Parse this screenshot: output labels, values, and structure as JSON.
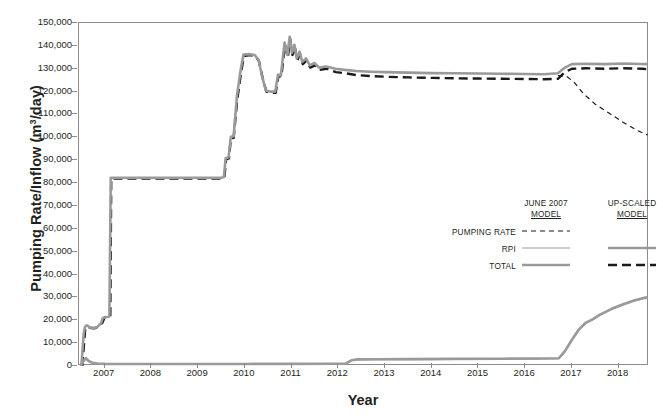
{
  "chart_data": {
    "type": "line",
    "title": "",
    "xlabel": "Year",
    "ylabel": "Pumping Rate/Inflow (m3/day)",
    "ylabel_parts": {
      "pre": "Pumping Rate/Inflow (m",
      "sup": "3",
      "post": "/day)"
    },
    "grid": false,
    "xlim": [
      2006.45,
      2018.65
    ],
    "ylim": [
      0,
      150000
    ],
    "ytick_step": 10000,
    "yticks": [
      "0",
      "10,000",
      "20,000",
      "30,000",
      "40,000",
      "50,000",
      "60,000",
      "70,000",
      "80,000",
      "90,000",
      "100,000",
      "110,000",
      "120,000",
      "130,000",
      "140,000",
      "150,000"
    ],
    "ytick_values": [
      0,
      10000,
      20000,
      30000,
      40000,
      50000,
      60000,
      70000,
      80000,
      90000,
      100000,
      110000,
      120000,
      130000,
      140000,
      150000
    ],
    "xticks": [
      "2007",
      "2008",
      "2009",
      "2010",
      "2011",
      "2012",
      "2013",
      "2014",
      "2015",
      "2016",
      "2017",
      "2018"
    ],
    "xtick_values": [
      2007,
      2008,
      2009,
      2010,
      2011,
      2012,
      2013,
      2014,
      2015,
      2016,
      2017,
      2018
    ],
    "legend_position": "inside-right",
    "colors": {
      "gray": "#9a9a9a",
      "black": "#1a1a1a",
      "axis": "#8c8c8c"
    },
    "series": [
      {
        "name": "TOTAL up-scaled model",
        "legend_row": "TOTAL",
        "legend_column": "UP-SCALED MODEL",
        "style": "dashed-thick",
        "color": "#1a1a1a",
        "points": [
          [
            2006.52,
            0
          ],
          [
            2006.58,
            15500
          ],
          [
            2006.62,
            17400
          ],
          [
            2006.7,
            16600
          ],
          [
            2006.78,
            16500
          ],
          [
            2006.86,
            17100
          ],
          [
            2006.95,
            18900
          ],
          [
            2007.0,
            21300
          ],
          [
            2007.06,
            21500
          ],
          [
            2007.12,
            21600
          ],
          [
            2007.14,
            82000
          ],
          [
            2009.52,
            82000
          ],
          [
            2009.56,
            82200
          ],
          [
            2009.6,
            90500
          ],
          [
            2009.66,
            90800
          ],
          [
            2009.7,
            99500
          ],
          [
            2009.76,
            99800
          ],
          [
            2009.84,
            117000
          ],
          [
            2009.92,
            128500
          ],
          [
            2009.98,
            135500
          ],
          [
            2010.1,
            136000
          ],
          [
            2010.22,
            135600
          ],
          [
            2010.3,
            133500
          ],
          [
            2010.38,
            126000
          ],
          [
            2010.46,
            120000
          ],
          [
            2010.54,
            119500
          ],
          [
            2010.66,
            119500
          ],
          [
            2010.72,
            127000
          ],
          [
            2010.78,
            126500
          ],
          [
            2010.86,
            140500
          ],
          [
            2010.92,
            135000
          ],
          [
            2010.97,
            143000
          ],
          [
            2011.02,
            136000
          ],
          [
            2011.07,
            139500
          ],
          [
            2011.12,
            133500
          ],
          [
            2011.18,
            136500
          ],
          [
            2011.24,
            132000
          ],
          [
            2011.32,
            133500
          ],
          [
            2011.4,
            130500
          ],
          [
            2011.5,
            131500
          ],
          [
            2011.6,
            129500
          ],
          [
            2011.75,
            130000
          ],
          [
            2011.95,
            128500
          ],
          [
            2012.15,
            128000
          ],
          [
            2012.4,
            127200
          ],
          [
            2012.7,
            126800
          ],
          [
            2013.0,
            126500
          ],
          [
            2013.5,
            126200
          ],
          [
            2014.0,
            126000
          ],
          [
            2014.5,
            125800
          ],
          [
            2015.0,
            125700
          ],
          [
            2015.5,
            125600
          ],
          [
            2016.0,
            125500
          ],
          [
            2016.4,
            125400
          ],
          [
            2016.7,
            125600
          ],
          [
            2016.85,
            128500
          ],
          [
            2017.0,
            130000
          ],
          [
            2017.3,
            130200
          ],
          [
            2017.7,
            130000
          ],
          [
            2018.1,
            130200
          ],
          [
            2018.5,
            130000
          ],
          [
            2018.62,
            129800
          ]
        ]
      },
      {
        "name": "TOTAL June 2007 model / RPI up-scaled (upper gray band)",
        "legend_row": "TOTAL",
        "legend_column": "JUNE 2007 MODEL",
        "style": "solid-thick",
        "color": "#9a9a9a",
        "points": [
          [
            2006.5,
            0
          ],
          [
            2006.55,
            14000
          ],
          [
            2006.58,
            17200
          ],
          [
            2006.62,
            17800
          ],
          [
            2006.68,
            16900
          ],
          [
            2006.76,
            16600
          ],
          [
            2006.84,
            17000
          ],
          [
            2006.92,
            18700
          ],
          [
            2006.96,
            21000
          ],
          [
            2007.04,
            21400
          ],
          [
            2007.1,
            21700
          ],
          [
            2007.13,
            82300
          ],
          [
            2009.5,
            82300
          ],
          [
            2009.55,
            82600
          ],
          [
            2009.59,
            91000
          ],
          [
            2009.65,
            91200
          ],
          [
            2009.7,
            100200
          ],
          [
            2009.76,
            100500
          ],
          [
            2009.83,
            118000
          ],
          [
            2009.91,
            129500
          ],
          [
            2009.97,
            136200
          ],
          [
            2010.09,
            136400
          ],
          [
            2010.21,
            136000
          ],
          [
            2010.29,
            134000
          ],
          [
            2010.37,
            126500
          ],
          [
            2010.45,
            120500
          ],
          [
            2010.53,
            120000
          ],
          [
            2010.65,
            120000
          ],
          [
            2010.71,
            127500
          ],
          [
            2010.77,
            127000
          ],
          [
            2010.85,
            141500
          ],
          [
            2010.91,
            136000
          ],
          [
            2010.96,
            144000
          ],
          [
            2011.01,
            137000
          ],
          [
            2011.06,
            140500
          ],
          [
            2011.11,
            134500
          ],
          [
            2011.17,
            137500
          ],
          [
            2011.23,
            133000
          ],
          [
            2011.31,
            134500
          ],
          [
            2011.39,
            131500
          ],
          [
            2011.49,
            132500
          ],
          [
            2011.59,
            130500
          ],
          [
            2011.74,
            131000
          ],
          [
            2011.94,
            130000
          ],
          [
            2012.14,
            129500
          ],
          [
            2012.39,
            129000
          ],
          [
            2012.69,
            128700
          ],
          [
            2013.0,
            128500
          ],
          [
            2013.5,
            128300
          ],
          [
            2014.0,
            128100
          ],
          [
            2014.5,
            128000
          ],
          [
            2015.0,
            127900
          ],
          [
            2015.5,
            127800
          ],
          [
            2016.0,
            127700
          ],
          [
            2016.4,
            127600
          ],
          [
            2016.7,
            128000
          ],
          [
            2016.85,
            130500
          ],
          [
            2017.0,
            132000
          ],
          [
            2017.3,
            132200
          ],
          [
            2017.7,
            132000
          ],
          [
            2018.1,
            132300
          ],
          [
            2018.5,
            132100
          ],
          [
            2018.62,
            132000
          ]
        ]
      },
      {
        "name": "PUMPING RATE June 2007 model",
        "legend_row": "PUMPING RATE",
        "legend_column": "JUNE 2007 MODEL",
        "style": "dashed-thin",
        "color": "#1a1a1a",
        "points": [
          [
            2016.7,
            127000
          ],
          [
            2016.9,
            126500
          ],
          [
            2017.05,
            124000
          ],
          [
            2017.25,
            119000
          ],
          [
            2017.5,
            114500
          ],
          [
            2017.8,
            110500
          ],
          [
            2018.1,
            106500
          ],
          [
            2018.4,
            103000
          ],
          [
            2018.62,
            101000
          ]
        ]
      },
      {
        "name": "RPI up-scaled model (lower curve)",
        "legend_row": "RPI",
        "legend_column": "UP-SCALED MODEL",
        "style": "solid-thick",
        "color": "#9a9a9a",
        "points": [
          [
            2006.5,
            600
          ],
          [
            2006.56,
            2600
          ],
          [
            2006.6,
            3400
          ],
          [
            2006.66,
            2200
          ],
          [
            2006.74,
            1400
          ],
          [
            2006.85,
            1100
          ],
          [
            2007.0,
            950
          ],
          [
            2007.4,
            900
          ],
          [
            2008.0,
            850
          ],
          [
            2009.0,
            850
          ],
          [
            2010.0,
            900
          ],
          [
            2011.0,
            950
          ],
          [
            2011.8,
            1000
          ],
          [
            2012.15,
            1050
          ],
          [
            2012.28,
            2500
          ],
          [
            2012.4,
            2900
          ],
          [
            2012.8,
            2950
          ],
          [
            2013.5,
            3000
          ],
          [
            2014.5,
            3100
          ],
          [
            2015.5,
            3200
          ],
          [
            2016.3,
            3300
          ],
          [
            2016.72,
            3400
          ],
          [
            2016.85,
            6500
          ],
          [
            2017.0,
            11500
          ],
          [
            2017.15,
            16000
          ],
          [
            2017.3,
            19000
          ],
          [
            2017.45,
            20500
          ],
          [
            2017.6,
            22500
          ],
          [
            2017.85,
            25000
          ],
          [
            2018.1,
            27000
          ],
          [
            2018.35,
            28800
          ],
          [
            2018.55,
            29800
          ],
          [
            2018.62,
            30000
          ]
        ]
      },
      {
        "name": "RPI June 2007 model (lower curve)",
        "legend_row": "RPI",
        "legend_column": "JUNE 2007 MODEL",
        "style": "solid-thin",
        "color": "#9a9a9a",
        "points": [
          [
            2006.5,
            400
          ],
          [
            2006.56,
            2200
          ],
          [
            2006.6,
            3000
          ],
          [
            2006.66,
            1900
          ],
          [
            2006.74,
            1200
          ],
          [
            2006.85,
            900
          ],
          [
            2007.0,
            800
          ],
          [
            2007.4,
            750
          ],
          [
            2008.0,
            720
          ],
          [
            2009.0,
            720
          ],
          [
            2010.0,
            760
          ],
          [
            2011.0,
            800
          ],
          [
            2011.8,
            850
          ],
          [
            2012.15,
            900
          ],
          [
            2012.28,
            2300
          ],
          [
            2012.4,
            2700
          ],
          [
            2012.8,
            2750
          ],
          [
            2013.5,
            2800
          ],
          [
            2014.5,
            2900
          ],
          [
            2015.5,
            3000
          ],
          [
            2016.3,
            3100
          ],
          [
            2016.72,
            3200
          ],
          [
            2016.85,
            6200
          ],
          [
            2017.0,
            11200
          ],
          [
            2017.15,
            15700
          ],
          [
            2017.3,
            18700
          ],
          [
            2017.45,
            20200
          ],
          [
            2017.6,
            22200
          ],
          [
            2017.85,
            24700
          ],
          [
            2018.1,
            26700
          ],
          [
            2018.35,
            28500
          ],
          [
            2018.55,
            29500
          ],
          [
            2018.62,
            29700
          ]
        ]
      }
    ]
  },
  "legend": {
    "columns": [
      {
        "line1": "JUNE 2007",
        "line2": "MODEL"
      },
      {
        "line1": "UP-SCALED",
        "line2": "MODEL"
      }
    ],
    "rows": [
      {
        "label": "PUMPING RATE",
        "june_style": "dashed-thin",
        "upscaled_style": "none"
      },
      {
        "label": "RPI",
        "june_style": "solid-thin",
        "upscaled_style": "solid-thick"
      },
      {
        "label": "TOTAL",
        "june_style": "solid-thick",
        "upscaled_style": "dashed-thick"
      }
    ]
  }
}
